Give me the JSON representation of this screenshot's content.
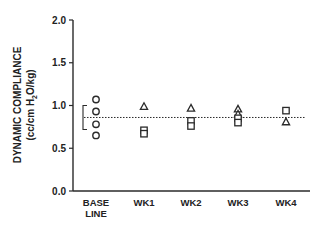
{
  "chart_data": {
    "type": "scatter",
    "title": "",
    "xlabel": "",
    "ylabel": "DYNAMIC COMPLIANCE (cc/cm H2O/kg)",
    "ylabel_line1": "DYNAMIC COMPLIANCE",
    "ylabel_line2_pre": "(cc/cm H",
    "ylabel_line2_sub": "2",
    "ylabel_line2_post": "O/kg)",
    "ylim": [
      0,
      2.0
    ],
    "yticks": [
      0.0,
      0.5,
      1.0,
      1.5,
      2.0
    ],
    "ytick_labels": [
      "0.0",
      "0.5",
      "1.0",
      "1.5",
      "2.0"
    ],
    "categories": [
      "BASE LINE",
      "WK1",
      "WK2",
      "WK3",
      "WK4"
    ],
    "category_lines": [
      [
        "BASE",
        "LINE"
      ],
      [
        "WK1"
      ],
      [
        "WK2"
      ],
      [
        "WK3"
      ],
      [
        "WK4"
      ]
    ],
    "grid": false,
    "legend": null,
    "series": [
      {
        "name": "circle",
        "marker": "circle",
        "points": [
          {
            "category": "BASE LINE",
            "values": [
              1.07,
              0.93,
              0.78,
              0.65
            ]
          }
        ]
      },
      {
        "name": "triangle",
        "marker": "triangle",
        "points": [
          {
            "category": "WK1",
            "values": [
              0.99
            ]
          },
          {
            "category": "WK2",
            "values": [
              0.97
            ]
          },
          {
            "category": "WK3",
            "values": [
              0.96,
              0.9
            ]
          },
          {
            "category": "WK4",
            "values": [
              0.81
            ]
          }
        ]
      },
      {
        "name": "square",
        "marker": "square",
        "points": [
          {
            "category": "WK1",
            "values": [
              0.71,
              0.67
            ]
          },
          {
            "category": "WK2",
            "values": [
              0.82,
              0.76
            ]
          },
          {
            "category": "WK3",
            "values": [
              0.85,
              0.8
            ]
          },
          {
            "category": "WK4",
            "values": [
              0.94
            ]
          }
        ]
      }
    ],
    "annotations": {
      "reference_line": {
        "style": "dotted",
        "value": 0.86,
        "label": "baseline mean"
      },
      "baseline_range_bracket": {
        "low": 0.72,
        "high": 1.0
      }
    }
  }
}
